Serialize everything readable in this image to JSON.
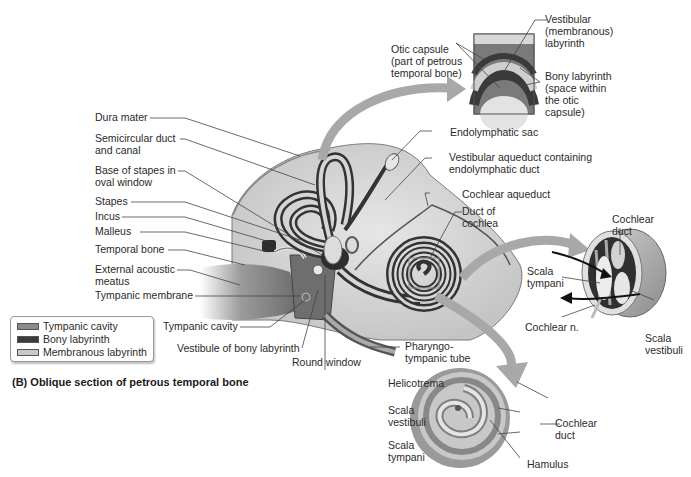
{
  "figure": {
    "caption": "(B) Oblique section of petrous temporal bone"
  },
  "legend": {
    "items": [
      {
        "label": "Tympanic cavity",
        "color": "#8a8a8a"
      },
      {
        "label": "Bony labyrinth",
        "color": "#3c3c3c"
      },
      {
        "label": "Membranous labyrinth",
        "color": "#c9c9c9"
      }
    ]
  },
  "labels_left": {
    "dura_mater": "Dura mater",
    "semicircular_1": "Semicircular duct",
    "semicircular_2": "and canal",
    "base_stapes_1": "Base of stapes in",
    "base_stapes_2": "oval window",
    "stapes": "Stapes",
    "incus": "Incus",
    "malleus": "Malleus",
    "temporal_bone": "Temporal bone",
    "ext_acoustic_1": "External acoustic",
    "ext_acoustic_2": "meatus",
    "tympanic_membrane": "Tympanic membrane"
  },
  "labels_bottom": {
    "tympanic_cavity": "Tympanic cavity",
    "vestibule": "Vestibule of bony labyrinth",
    "round_window": "Round window",
    "pharyngo_1": "Pharyngo-",
    "pharyngo_2": "tympanic tube"
  },
  "labels_top_inset": {
    "otic_capsule_1": "Otic capsule",
    "otic_capsule_2": "(part of petrous",
    "otic_capsule_3": "temporal bone)",
    "vestibular_1": "Vestibular",
    "vestibular_2": "(membranous)",
    "vestibular_3": "labyrinth",
    "bony_1": "Bony labyrinth",
    "bony_2": "(space within",
    "bony_3": "the otic",
    "bony_4": "capsule)"
  },
  "labels_right": {
    "endolymphatic_sac": "Endolymphatic sac",
    "vestib_aqueduct_1": "Vestibular aqueduct containing",
    "vestib_aqueduct_2": "endolymphatic duct",
    "cochlear_aqueduct": "Cochlear aqueduct",
    "duct_cochlea_1": "Duct of",
    "duct_cochlea_2": "cochlea"
  },
  "labels_cross_section": {
    "cochlear_duct_1": "Cochlear",
    "cochlear_duct_2": "duct",
    "scala_tympani_1": "Scala",
    "scala_tympani_2": "tympani",
    "cochlear_n": "Cochlear n.",
    "scala_vestibuli_1": "Scala",
    "scala_vestibuli_2": "vestibuli"
  },
  "labels_spiral": {
    "helicotrema": "Helicotrema",
    "scala_vestibuli_1": "Scala",
    "scala_vestibuli_2": "vestibuli",
    "scala_tympani_1": "Scala",
    "scala_tympani_2": "tympani",
    "cochlear_duct_1": "Cochlear",
    "cochlear_duct_2": "duct",
    "hamulus": "Hamulus"
  },
  "colors": {
    "bone": "#d9d9d9",
    "bony_labyrinth": "#3c3c3c",
    "membranous": "#c9c9c9",
    "arrow": "#a8a8a8",
    "leader": "#444444"
  }
}
